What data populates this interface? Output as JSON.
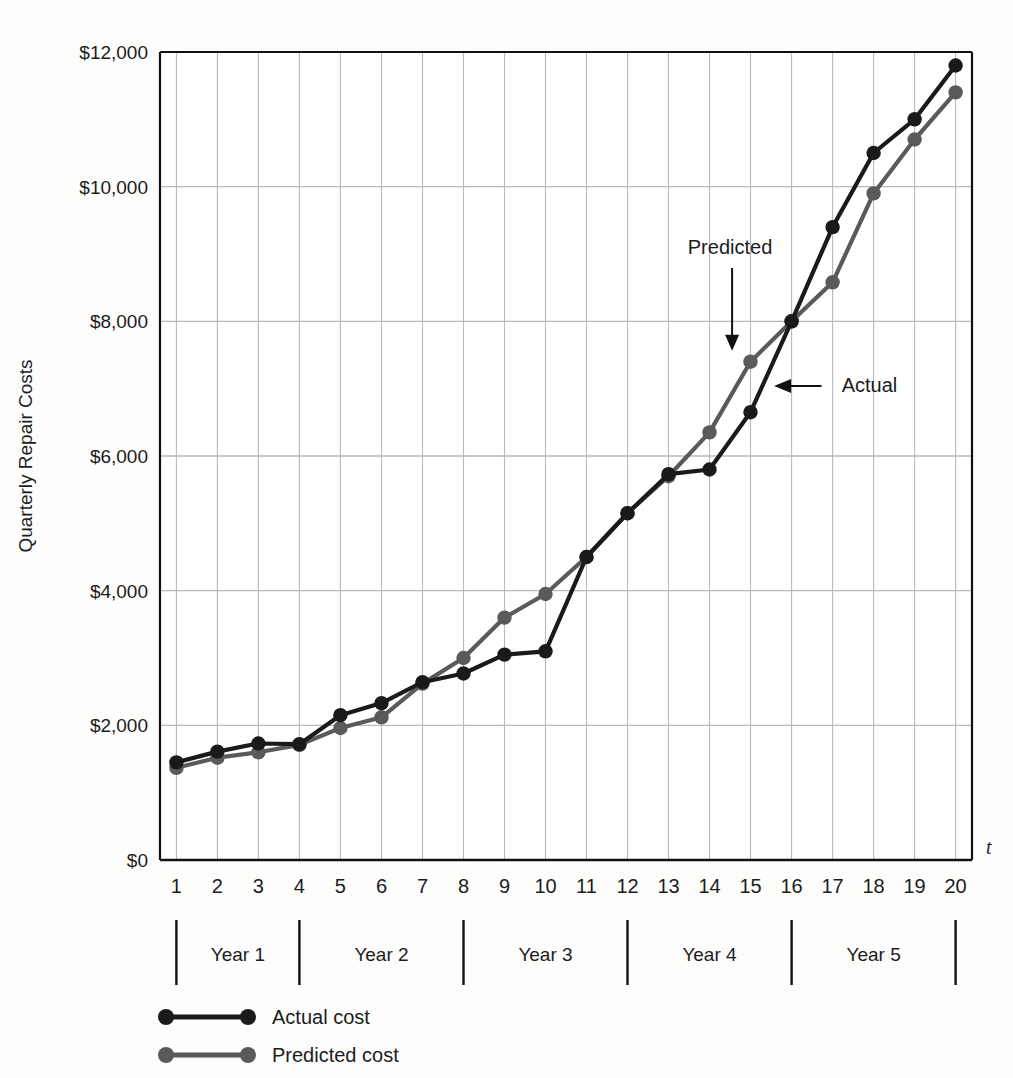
{
  "chart_data": {
    "type": "line",
    "title": "",
    "xlabel": "t",
    "ylabel": "Quarterly Repair Costs",
    "x": [
      1,
      2,
      3,
      4,
      5,
      6,
      7,
      8,
      9,
      10,
      11,
      12,
      13,
      14,
      15,
      16,
      17,
      18,
      19,
      20
    ],
    "xlim": [
      0.6,
      20.4
    ],
    "ylim": [
      0,
      12000
    ],
    "grid": true,
    "legend_position": "below-axes-left",
    "xtick_labels": [
      "1",
      "2",
      "3",
      "4",
      "5",
      "6",
      "7",
      "8",
      "9",
      "10",
      "11",
      "12",
      "13",
      "14",
      "15",
      "16",
      "17",
      "18",
      "19",
      "20"
    ],
    "ytick_labels": [
      "$0",
      "$2,000",
      "$4,000",
      "$6,000",
      "$8,000",
      "$10,000",
      "$12,000"
    ],
    "ytick_values": [
      0,
      2000,
      4000,
      6000,
      8000,
      10000,
      12000
    ],
    "series": [
      {
        "name": "Actual cost",
        "color": "#1a1a1a",
        "values": [
          1450,
          1610,
          1730,
          1720,
          2150,
          2330,
          2640,
          2770,
          3050,
          3100,
          4500,
          5150,
          5730,
          5800,
          6650,
          8000,
          9400,
          10500,
          11000,
          11800
        ]
      },
      {
        "name": "Predicted cost",
        "color": "#5a5a5a",
        "values": [
          1370,
          1520,
          1600,
          1710,
          1960,
          2120,
          2620,
          3000,
          3600,
          3950,
          4500,
          5150,
          5700,
          6350,
          7400,
          8000,
          8580,
          9900,
          10700,
          11400
        ]
      }
    ],
    "annotations": [
      {
        "text": "Predicted",
        "x": 14.5,
        "y": 9000,
        "arrow": "down",
        "target_x": 14.55,
        "target_y": 7550
      },
      {
        "text": "Actual",
        "x": 17.9,
        "y": 6950,
        "arrow": "left",
        "target_x": 15.55,
        "target_y": 6950
      }
    ],
    "year_brackets": [
      {
        "label": "Year 1",
        "start": 1,
        "end": 4
      },
      {
        "label": "Year 2",
        "start": 4,
        "end": 8
      },
      {
        "label": "Year 3",
        "start": 8,
        "end": 12
      },
      {
        "label": "Year 4",
        "start": 12,
        "end": 16
      },
      {
        "label": "Year 5",
        "start": 16,
        "end": 20
      }
    ]
  },
  "legend": {
    "items": [
      {
        "label": "Actual cost"
      },
      {
        "label": "Predicted cost"
      }
    ]
  },
  "colors": {
    "actual": "#1a1a1a",
    "predicted": "#5a5a5a",
    "grid": "#b9b9b9",
    "axis": "#111111",
    "background": "#fdfdfc"
  }
}
